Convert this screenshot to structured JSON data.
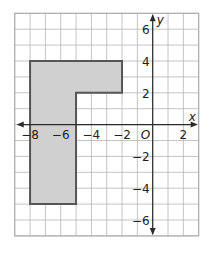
{
  "figure": {
    "type": "coordinate-plane",
    "x_range": [
      -9,
      3
    ],
    "y_range": [
      -7,
      7
    ],
    "x_axis_label": "x",
    "y_axis_label": "y",
    "origin_label": "O",
    "x_tick_labels": [
      {
        "value": -8,
        "label": "−8"
      },
      {
        "value": -6,
        "label": "−6"
      },
      {
        "value": -4,
        "label": "−4"
      },
      {
        "value": -2,
        "label": "−2"
      },
      {
        "value": 2,
        "label": "2"
      }
    ],
    "y_tick_labels": [
      {
        "value": 6,
        "label": "6"
      },
      {
        "value": 4,
        "label": "4"
      },
      {
        "value": 2,
        "label": "2"
      },
      {
        "value": -2,
        "label": "−2"
      },
      {
        "value": -4,
        "label": "−4"
      },
      {
        "value": -6,
        "label": "−6"
      }
    ],
    "polygon": {
      "vertices": [
        [
          -8,
          4
        ],
        [
          -2,
          4
        ],
        [
          -2,
          2
        ],
        [
          -5,
          2
        ],
        [
          -5,
          -5
        ],
        [
          -8,
          -5
        ]
      ],
      "fill": "#d0d0d0",
      "stroke": "#555555"
    }
  }
}
